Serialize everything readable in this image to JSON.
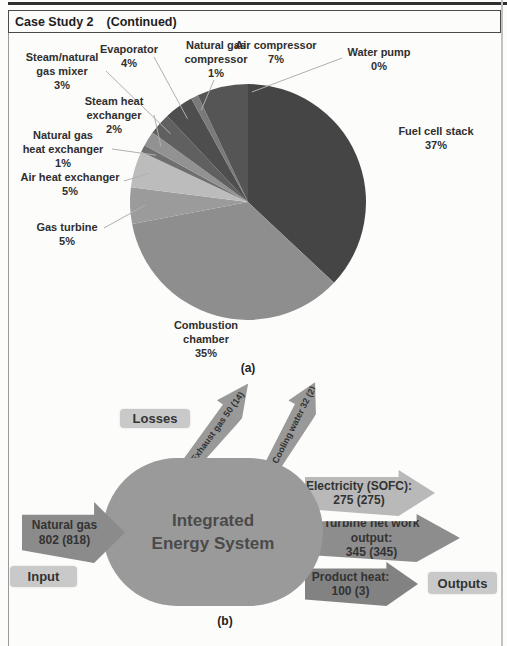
{
  "page": {
    "header_title": "Case Study 2",
    "header_continued": "(Continued)",
    "caption_a": "(a)",
    "caption_b": "(b)"
  },
  "chart_data": {
    "type": "pie",
    "title": "",
    "start_angle_deg": 0,
    "direction": "clockwise",
    "legend": "callout-labels",
    "slices": [
      {
        "label": "Fuel cell stack",
        "pct": 37,
        "color": "#454545",
        "label_lines": [
          "Fuel cell stack",
          "37%"
        ]
      },
      {
        "label": "Combustion chamber",
        "pct": 35,
        "color": "#8e8e8e",
        "label_lines": [
          "Combustion",
          "chamber",
          "35%"
        ]
      },
      {
        "label": "Gas turbine",
        "pct": 5,
        "color": "#9b9b9b",
        "label_lines": [
          "Gas turbine",
          "5%"
        ]
      },
      {
        "label": "Air heat exchanger",
        "pct": 5,
        "color": "#bcbcbc",
        "label_lines": [
          "Air heat exchanger",
          "5%"
        ]
      },
      {
        "label": "Natural gas heat exchanger",
        "pct": 1,
        "color": "#6f6f6f",
        "label_lines": [
          "Natural gas",
          "heat exchanger",
          "1%"
        ]
      },
      {
        "label": "Steam heat exchanger",
        "pct": 2,
        "color": "#929292",
        "label_lines": [
          "Steam heat",
          "exchanger",
          "2%"
        ]
      },
      {
        "label": "Steam/natural gas mixer",
        "pct": 3,
        "color": "#606060",
        "label_lines": [
          "Steam/natural",
          "gas mixer",
          "3%"
        ]
      },
      {
        "label": "Evaporator",
        "pct": 4,
        "color": "#4e4e4e",
        "label_lines": [
          "Evaporator",
          "4%"
        ]
      },
      {
        "label": "Natural gas compressor",
        "pct": 1,
        "color": "#7a7a7a",
        "label_lines": [
          "Natural gas",
          "compressor",
          "1%"
        ]
      },
      {
        "label": "Air compressor",
        "pct": 7,
        "color": "#555555",
        "label_lines": [
          "Air compressor",
          "7%"
        ]
      },
      {
        "label": "Water pump",
        "pct": 0,
        "color": "#444444",
        "label_lines": [
          "Water pump",
          "0%"
        ]
      }
    ]
  },
  "diagram": {
    "system_label_line1": "Integrated",
    "system_label_line2": "Energy System",
    "badges": {
      "losses": "Losses",
      "input": "Input",
      "outputs": "Outputs"
    },
    "flows": {
      "natural_gas": {
        "line1": "Natural gas",
        "line2": "802 (818)"
      },
      "exhaust_gas": {
        "label": "Exhaust gas 50 (14)"
      },
      "cooling_water": {
        "label": "Cooling water 32 (2)"
      },
      "electricity": {
        "line1": "Electricity (SOFC):",
        "line2": "275 (275)"
      },
      "turbine": {
        "line1": "Turbine net work output:",
        "line2": "345 (345)"
      },
      "product_heat": {
        "line1": "Product heat:",
        "line2": "100 (3)"
      }
    },
    "colors": {
      "system_box": "#9a9a9a",
      "input_arrow": "#8b8b8b",
      "electricity_arrow": "#b9b9b9",
      "turbine_arrow": "#8d8d8d",
      "product_heat_arrow": "#828282",
      "loss_arrows": "#999999",
      "badge_bg": "#c9c9c9",
      "text_dark": "#333333"
    }
  }
}
